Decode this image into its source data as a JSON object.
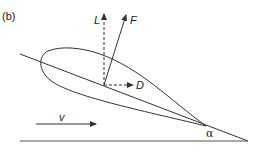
{
  "figure": {
    "panel_label": "(b)",
    "forces": {
      "lift": "L",
      "resultant": "F",
      "drag": "D"
    },
    "velocity_label": "v",
    "angle_label": "α",
    "colors": {
      "stroke": "#333333",
      "background": "#ffffff"
    }
  }
}
